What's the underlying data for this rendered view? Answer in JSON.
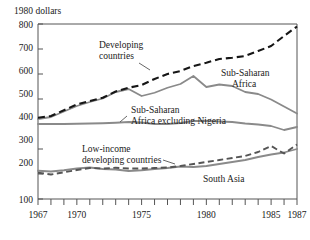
{
  "chart_data": {
    "type": "line",
    "title": "",
    "ylabel": "1980 dollars",
    "xlabel": "",
    "ylim": [
      100,
      800
    ],
    "xlim": [
      1967,
      1987
    ],
    "yticks": [
      100,
      200,
      300,
      400,
      500,
      600,
      700,
      800
    ],
    "ytick_labels": [
      "100",
      "200",
      "300",
      "400",
      "500",
      "600",
      "700",
      "800"
    ],
    "xticks": [
      1967,
      1968,
      1969,
      1970,
      1971,
      1972,
      1973,
      1974,
      1975,
      1976,
      1977,
      1978,
      1979,
      1980,
      1981,
      1982,
      1983,
      1984,
      1985,
      1986,
      1987
    ],
    "xtick_labels_shown": [
      "1967",
      "1970",
      "1975",
      "1980",
      "1985",
      "1987"
    ],
    "xtick_label_years": [
      1967,
      1970,
      1975,
      1980,
      1985,
      1987
    ],
    "grid": false,
    "legend_position": "inline-annotations",
    "x": [
      1967,
      1968,
      1969,
      1970,
      1971,
      1972,
      1973,
      1974,
      1975,
      1976,
      1977,
      1978,
      1979,
      1980,
      1981,
      1982,
      1983,
      1984,
      1985,
      1986,
      1987
    ],
    "series": [
      {
        "name": "Developing countries",
        "style": "dashed",
        "color": "#161616",
        "values": [
          425,
          432,
          455,
          478,
          492,
          505,
          530,
          545,
          556,
          580,
          600,
          612,
          632,
          645,
          660,
          665,
          672,
          692,
          712,
          752,
          790
        ]
      },
      {
        "name": "Sub-Saharan Africa",
        "style": "solid",
        "color": "#8a8a8a",
        "values": [
          420,
          428,
          450,
          472,
          488,
          502,
          528,
          540,
          512,
          525,
          545,
          560,
          592,
          548,
          558,
          552,
          528,
          520,
          498,
          470,
          442
        ]
      },
      {
        "name": "Sub-Saharan Africa excluding Nigeria",
        "style": "solid",
        "color": "#8a8a8a",
        "values": [
          400,
          400,
          400,
          401,
          402,
          403,
          405,
          408,
          406,
          400,
          400,
          404,
          412,
          412,
          410,
          408,
          402,
          398,
          392,
          376,
          388
        ]
      },
      {
        "name": "Low-income developing countries",
        "style": "dashed",
        "color": "#555555",
        "values": [
          205,
          198,
          207,
          216,
          224,
          222,
          225,
          222,
          222,
          224,
          226,
          232,
          240,
          248,
          256,
          264,
          272,
          288,
          312,
          282,
          318
        ]
      },
      {
        "name": "South Asia",
        "style": "solid",
        "color": "#8a8a8a",
        "values": [
          213,
          210,
          215,
          222,
          226,
          220,
          218,
          212,
          215,
          220,
          224,
          230,
          228,
          232,
          240,
          248,
          256,
          268,
          278,
          286,
          300
        ]
      }
    ],
    "annotations": [
      {
        "text": "Developing\ncountries",
        "line1": "Developing",
        "line2": "countries"
      },
      {
        "text": "Sub-Saharan\nAfrica",
        "line1": "Sub-Saharan",
        "line2": "Africa"
      },
      {
        "text": "Sub-Saharan\nAfrica excluding Nigeria",
        "line1": "Sub-Saharan",
        "line2": "Africa excluding Nigeria"
      },
      {
        "text": "Low-income\ndeveloping countries",
        "line1": "Low-income",
        "line2": "developing countries"
      },
      {
        "text": "South Asia",
        "line1": "South Asia",
        "line2": ""
      }
    ]
  },
  "labels": {
    "y_axis_title": "1980 dollars",
    "developing_countries_1": "Developing",
    "developing_countries_2": "countries",
    "ssa_1": "Sub-Saharan",
    "ssa_2": "Africa",
    "ssa_ex_nigeria_1": "Sub-Saharan",
    "ssa_ex_nigeria_2": "Africa excluding Nigeria",
    "low_income_1": "Low-income",
    "low_income_2": "developing countries",
    "south_asia": "South Asia",
    "y_100": "100",
    "y_200": "200",
    "y_300": "300",
    "y_400": "400",
    "y_500": "500",
    "y_600": "600",
    "y_700": "700",
    "y_800": "800",
    "x_1967": "1967",
    "x_1970": "1970",
    "x_1975": "1975",
    "x_1980": "1980",
    "x_1985": "1985",
    "x_1987": "1987"
  }
}
